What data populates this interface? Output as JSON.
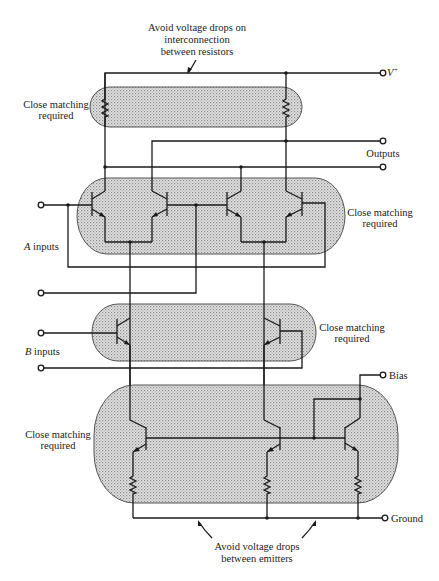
{
  "annotations": {
    "top_note": [
      "Avoid voltage drops on",
      "interconnection",
      "between resistors"
    ],
    "bottom_note": [
      "Avoid voltage drops",
      "between emitters"
    ],
    "resistor_band": [
      "Close matching",
      "required"
    ],
    "a_band": [
      "Close matching",
      "required"
    ],
    "b_band": [
      "Close matching",
      "required"
    ],
    "bias_band": [
      "Close matching",
      "required"
    ]
  },
  "terminals": {
    "vplus": "V",
    "vplus_sup": "+",
    "outputs": "Outputs",
    "a_inputs_letter": "A",
    "a_inputs": " inputs",
    "b_inputs_letter": "B",
    "b_inputs": " inputs",
    "bias": "Bias",
    "ground": "Ground"
  },
  "colors": {
    "line": "#1a1a1a",
    "band_fill": "#cfcfcf",
    "band_stroke": "#555555"
  }
}
